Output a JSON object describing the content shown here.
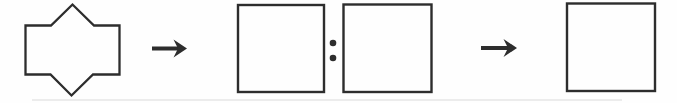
{
  "canvas": {
    "width": 677,
    "height": 103,
    "background": "#fefefe",
    "ink": "#2d2d2d"
  },
  "diagram": {
    "kind": "shape-analogy",
    "shape": {
      "name": "rectangle-with-top-and-bottom-triangular-peaks",
      "points": "25.5,25.5 51,25.5 72.5,4.5 94,25.5 119.5,25.5 119.5,74.5 93,74.5 71.5,95.5 50.5,74.5 25.5,74.5"
    },
    "arrow_left": {
      "glyph": "→",
      "shaft_d": "M152,48.5 L178.5,48.5",
      "head_points": "187,48.5 173.5,39.5 178,48.5 173.5,57.5"
    },
    "square_a": {
      "x": 238,
      "y": 5,
      "width": 86,
      "height": 87
    },
    "colon": {
      "glyph": ":",
      "cx": 333,
      "cy_top": 43,
      "cy_bottom": 58,
      "r": 3.3
    },
    "square_b": {
      "x": 343.5,
      "y": 4.5,
      "width": 88,
      "height": 87.5
    },
    "arrow_right": {
      "glyph": "→",
      "shaft_d": "M481,48 L508,48",
      "head_points": "517,48 503.5,39 508,48 503.5,57"
    },
    "square_c": {
      "x": 567,
      "y": 3.5,
      "width": 88,
      "height": 87.5
    }
  },
  "artifact": {
    "x1": 32,
    "x2": 622,
    "y": 100,
    "color": "#d7d7d7"
  }
}
